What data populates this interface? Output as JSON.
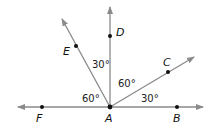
{
  "diagram": {
    "vertex": "A",
    "points": {
      "A": "A",
      "B": "B",
      "C": "C",
      "D": "D",
      "E": "E",
      "F": "F"
    },
    "angles": [
      {
        "between": "E-F",
        "label": "60°"
      },
      {
        "between": "D-E",
        "label": "30°"
      },
      {
        "between": "C-D",
        "label": "60°"
      },
      {
        "between": "B-C",
        "label": "30°"
      }
    ],
    "colors": {
      "line": "#8a8a8a",
      "point": "#111111"
    }
  }
}
